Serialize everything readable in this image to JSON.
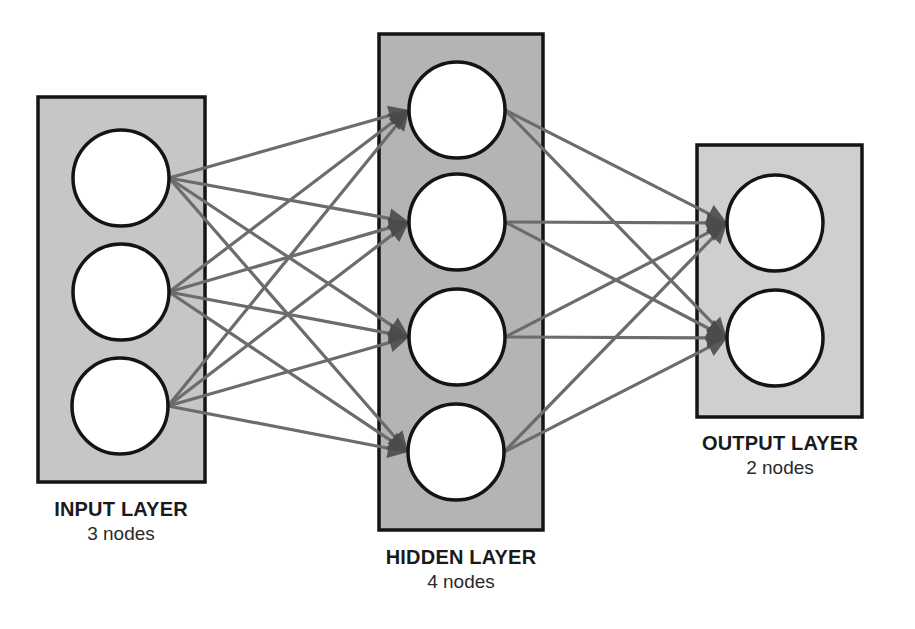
{
  "colors": {
    "background": "#ffffff",
    "edge": "#6c6c6c",
    "arrowhead": "#4a4a4a",
    "node_fill": "#ffffff",
    "node_stroke": "#141414",
    "box_stroke": "#141414"
  },
  "layers": [
    {
      "id": "input",
      "title": "INPUT LAYER",
      "subtitle": "3 nodes",
      "node_count": 3,
      "box": {
        "x": 38,
        "y": 97,
        "w": 167,
        "h": 385,
        "fill": "#c6c6c6"
      },
      "nodes": [
        {
          "cx": 121,
          "cy": 178
        },
        {
          "cx": 121,
          "cy": 292
        },
        {
          "cx": 120,
          "cy": 406
        }
      ],
      "label_pos": {
        "x": 121,
        "y": 497
      }
    },
    {
      "id": "hidden",
      "title": "HIDDEN LAYER",
      "subtitle": "4 nodes",
      "node_count": 4,
      "box": {
        "x": 379,
        "y": 34,
        "w": 164,
        "h": 496,
        "fill": "#b4b4b4"
      },
      "nodes": [
        {
          "cx": 457,
          "cy": 110
        },
        {
          "cx": 457,
          "cy": 222
        },
        {
          "cx": 457,
          "cy": 337
        },
        {
          "cx": 456,
          "cy": 452
        }
      ],
      "label_pos": {
        "x": 461,
        "y": 545
      }
    },
    {
      "id": "output",
      "title": "OUTPUT LAYER",
      "subtitle": "2 nodes",
      "node_count": 2,
      "box": {
        "x": 697,
        "y": 145,
        "w": 165,
        "h": 272,
        "fill": "#cfcfcf"
      },
      "nodes": [
        {
          "cx": 775,
          "cy": 223
        },
        {
          "cx": 775,
          "cy": 338
        }
      ],
      "label_pos": {
        "x": 780,
        "y": 431
      }
    }
  ],
  "node_radius": 48,
  "connections": "fully-connected input->hidden->output"
}
